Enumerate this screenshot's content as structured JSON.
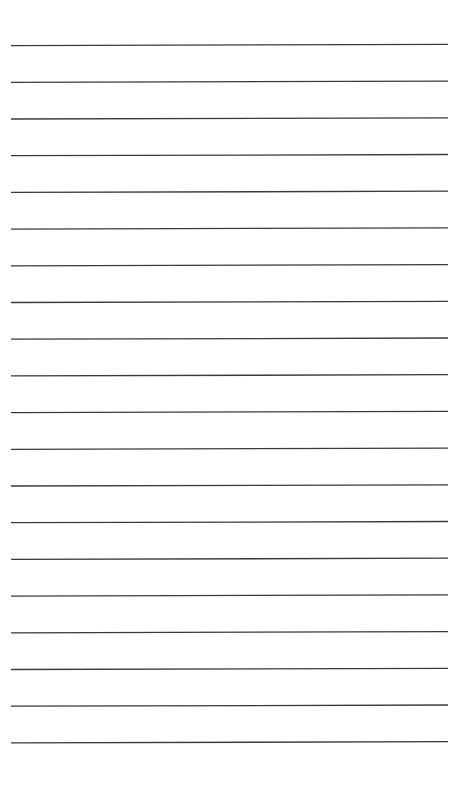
{
  "page": {
    "type": "ruled-lined-paper",
    "background_color": "#ffffff",
    "line_color": "#3a3a3a",
    "line_count": 20,
    "line_left_x": 11,
    "line_right_x": 448,
    "first_line_y": 45,
    "line_spacing": 36.7,
    "line_tilt": 1.2
  }
}
